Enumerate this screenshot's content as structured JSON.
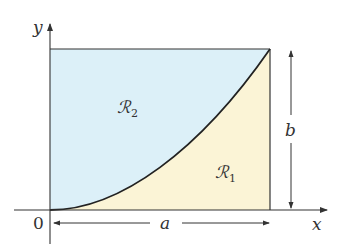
{
  "figure": {
    "type": "region diagram",
    "colors": {
      "region_r2_fill": "#dcf0f8",
      "region_r1_fill": "#fbf4d6",
      "line": "#333333"
    }
  },
  "labels": {
    "y_axis": "y",
    "x_axis": "x",
    "origin": "0",
    "width_dim": "a",
    "height_dim": "b",
    "region_upper": "ℛ",
    "region_upper_sub": "2",
    "region_lower": "ℛ",
    "region_lower_sub": "1"
  }
}
